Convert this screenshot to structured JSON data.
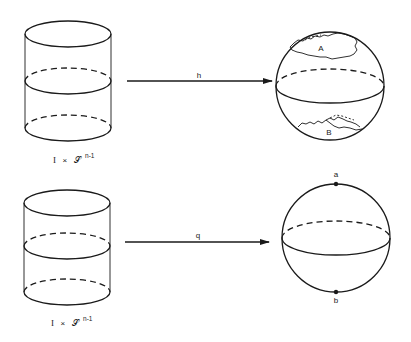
{
  "figure": {
    "top_row": {
      "source_label": {
        "prefix": "I",
        "times": "×",
        "space": "𝒮",
        "exponent": "n-1"
      },
      "map_label": "h",
      "region_labels": [
        "A",
        "B"
      ]
    },
    "bottom_row": {
      "source_label": {
        "prefix": "I",
        "times": "×",
        "space": "𝒮",
        "exponent": "n-1"
      },
      "map_label": "q",
      "point_labels": [
        "a",
        "b"
      ]
    }
  }
}
